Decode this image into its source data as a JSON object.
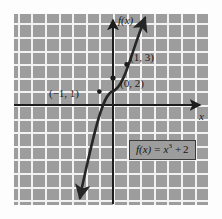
{
  "figure": {
    "kind": "cartesian-graph",
    "background_color": "#9d9d9d",
    "gridline_color": "#f2f2f2",
    "axis_color": "#1d1d1d",
    "curve_color": "#262626"
  },
  "axes": {
    "y_axis_label": "f(x)",
    "x_axis_label": "x",
    "origin_px": {
      "x": 113,
      "y": 105
    },
    "grid_spacing_px": 13.6
  },
  "annotations": {
    "point_neg1": "(−1, 1)",
    "point_zero": "(0, 2)",
    "point_one": "(1, 3)"
  },
  "equation_box": {
    "lhs": "f(x)",
    "equals": "=",
    "base": "x",
    "exponent": "3",
    "plus": "+",
    "constant": "2"
  },
  "chart_data": {
    "type": "line",
    "title": "",
    "subtitle": "",
    "xlabel": "x",
    "ylabel": "f(x)",
    "function": "f(x) = x^3 + 2",
    "grid": true,
    "legend": "none",
    "xlim": [
      -7.2,
      7.0
    ],
    "ylim": [
      -7.4,
      6.7
    ],
    "x": [
      -1.75,
      -1.5,
      -1.25,
      -1.0,
      -0.75,
      -0.5,
      -0.25,
      0.0,
      0.25,
      0.5,
      0.75,
      1.0,
      1.25,
      1.5
    ],
    "values": [
      -3.359,
      -1.375,
      0.047,
      1.0,
      1.578,
      1.875,
      1.984,
      2.0,
      2.016,
      2.125,
      2.422,
      3.0,
      3.953,
      5.375
    ],
    "labeled_points": [
      {
        "label": "(−1, 1)",
        "x": -1,
        "y": 1
      },
      {
        "label": "(0, 2)",
        "x": 0,
        "y": 2
      },
      {
        "label": "(1, 3)",
        "x": 1,
        "y": 3
      }
    ],
    "annotations": [
      "f(x) = x^3 + 2"
    ]
  }
}
